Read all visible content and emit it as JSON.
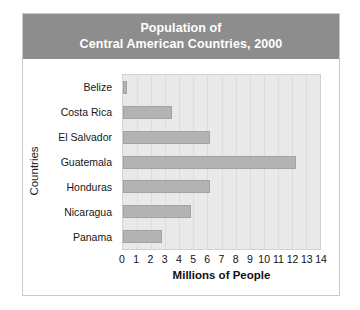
{
  "figure": {
    "title_lines": [
      "Population of",
      "Central American Countries, 2000"
    ],
    "banner_color": "#8d8d8d",
    "bar_color": "#b3b3b3",
    "plot_background": "#e9e9e9"
  },
  "chart_data": {
    "type": "bar",
    "orientation": "horizontal",
    "xlabel": "Millions of People",
    "ylabel": "Countries",
    "categories": [
      "Belize",
      "Costa Rica",
      "El Salvador",
      "Guatemala",
      "Honduras",
      "Nicaragua",
      "Panama"
    ],
    "values": [
      0.25,
      3.5,
      6.2,
      12.3,
      6.2,
      4.8,
      2.8
    ],
    "xlim": [
      0,
      14
    ],
    "xticks": [
      0,
      1,
      2,
      3,
      4,
      5,
      6,
      7,
      8,
      9,
      10,
      11,
      12,
      13,
      14
    ],
    "xtick_labels": [
      "0",
      "1",
      "2",
      "3",
      "4",
      "5",
      "6",
      "7",
      "8",
      "9",
      "10",
      "11",
      "12",
      "13",
      "14"
    ],
    "grid": "vertical",
    "legend": "none"
  }
}
